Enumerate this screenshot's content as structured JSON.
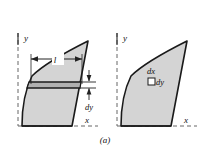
{
  "figure": {
    "caption": "(a)",
    "background_color": "#ffffff",
    "fill_color": "#d4d4d4",
    "outline_color": "#1a1a1a",
    "axis_color": "#555555",
    "strip_fill_color": "#b3b3b3",
    "panels": [
      {
        "id": "left-panel",
        "name": "horizontal-strip-element-panel",
        "axes": {
          "y_label": "y",
          "x_label": "x"
        },
        "annotations": [
          {
            "name": "length-label",
            "text": "l",
            "kind": "dimension-length"
          },
          {
            "name": "thickness-label",
            "text": "dy",
            "kind": "dimension-thickness"
          }
        ]
      },
      {
        "id": "right-panel",
        "name": "differential-element-panel",
        "axes": {
          "y_label": "y",
          "x_label": "x"
        },
        "annotations": [
          {
            "name": "dx-label",
            "text": "dx",
            "kind": "element-width"
          },
          {
            "name": "dy-label",
            "text": "dy",
            "kind": "element-height"
          }
        ]
      }
    ]
  }
}
